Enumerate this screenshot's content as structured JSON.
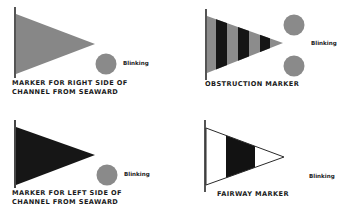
{
  "colors": {
    "gray": "#888888",
    "black": "#1a1a1a",
    "light_gray": "#8c8c8c",
    "white": "#ffffff",
    "pole": "#333333"
  },
  "markers": [
    {
      "id": "right-side",
      "label_line1": "MARKER FOR RIGHT SIDE OF",
      "label_line2": "CHANNEL FROM SEAWARD",
      "flag_fill": "gray",
      "lights": 1,
      "light_text": "Blinking"
    },
    {
      "id": "obstruction",
      "label_line1": "OBSTRUCTION MARKER",
      "flag_fill": "gray-black-stripes",
      "lights": 2,
      "light_text": "Blinking"
    },
    {
      "id": "left-side",
      "label_line1": "MARKER FOR LEFT SIDE OF",
      "label_line2": "CHANNEL FROM SEAWARD",
      "flag_fill": "black",
      "lights": 1,
      "light_text": "Blinking"
    },
    {
      "id": "fairway",
      "label_line1": "FAIRWAY MARKER",
      "flag_fill": "white-black-white",
      "lights": 0,
      "light_text": "Blinking"
    }
  ]
}
